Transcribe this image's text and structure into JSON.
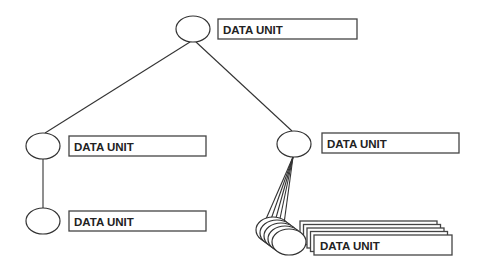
{
  "diagram": {
    "type": "hierarchy-tree",
    "nodes": [
      {
        "id": "root",
        "label": "DATA UNIT",
        "ellipse": {
          "cx": 193,
          "cy": 29,
          "rx": 17,
          "ry": 13
        },
        "box": {
          "x": 218,
          "y": 19,
          "w": 139,
          "h": 20
        }
      },
      {
        "id": "left-child",
        "label": "DATA UNIT",
        "ellipse": {
          "cx": 43,
          "cy": 146,
          "rx": 17,
          "ry": 13
        },
        "box": {
          "x": 69,
          "y": 136,
          "w": 137,
          "h": 20
        }
      },
      {
        "id": "left-grandchild",
        "label": "DATA UNIT",
        "ellipse": {
          "cx": 43,
          "cy": 221,
          "rx": 17,
          "ry": 13
        },
        "box": {
          "x": 69,
          "y": 211,
          "w": 137,
          "h": 20
        }
      },
      {
        "id": "right-child",
        "label": "DATA UNIT",
        "ellipse": {
          "cx": 294,
          "cy": 144,
          "rx": 17,
          "ry": 13
        },
        "box": {
          "x": 322,
          "y": 133,
          "w": 137,
          "h": 20
        }
      },
      {
        "id": "right-multi-children",
        "label": "DATA UNIT",
        "stack_count": 5,
        "ellipse": {
          "cx": 273,
          "cy": 230,
          "rx": 17,
          "ry": 13,
          "dx": 4,
          "dy": 3
        },
        "box": {
          "x": 300,
          "y": 221,
          "w": 137,
          "h": 20,
          "dx": 3.5,
          "dy": 3.5
        }
      }
    ],
    "edges": [
      {
        "from": "root",
        "to": "left-child"
      },
      {
        "from": "root",
        "to": "right-child"
      },
      {
        "from": "left-child",
        "to": "left-grandchild"
      },
      {
        "from": "right-child",
        "to": "right-multi-children",
        "fan": true
      }
    ],
    "colors": {
      "line": "#333333",
      "fill": "#ffffff"
    }
  }
}
